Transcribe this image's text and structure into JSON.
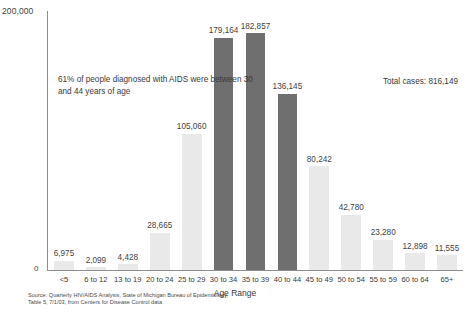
{
  "chart_data": {
    "type": "bar",
    "title": "",
    "xlabel": "Age Range",
    "ylabel": "",
    "ylim": [
      0,
      200000
    ],
    "grid": false,
    "legend": "none",
    "y_tick_labels": [
      "0",
      "200,000"
    ],
    "categories": [
      "<5",
      "6 to 12",
      "13 to 19",
      "20 to 24",
      "25 to 29",
      "30 to 34",
      "35 to 39",
      "40 to 44",
      "45 to 49",
      "50 to 54",
      "55 to 59",
      "60 to 64",
      "65+"
    ],
    "values": [
      6975,
      2099,
      4428,
      28665,
      105060,
      179164,
      182857,
      136145,
      80242,
      42780,
      23280,
      12898,
      11555
    ],
    "value_labels": [
      "6,975",
      "2,099",
      "4,428",
      "28,665",
      "105,060",
      "179,164",
      "182,857",
      "136,145",
      "80,242",
      "42,780",
      "23,280",
      "12,898",
      "11,555"
    ],
    "bar_styles": [
      "light",
      "light",
      "light",
      "light",
      "light",
      "dark",
      "dark",
      "dark",
      "light",
      "light",
      "light",
      "light",
      "light"
    ],
    "annotations": [
      "61% of people diagnosed with AIDS were between 30 and 44 years of age",
      "Total cases: 816,149"
    ],
    "colors": {
      "bar_light": "#e9e9e9",
      "bar_dark": "#6f6f6f",
      "axis": "#8d8d8d",
      "text": "#3a3a3a",
      "background": "#ffffff"
    }
  },
  "annotation_text": "61% of people diagnosed with AIDS were between 30 and 44 years of age",
  "total_cases_text": "Total cases: 816,149",
  "axis": {
    "y_max_label": "200,000",
    "y_zero_label": "0",
    "x_title": "Age Range"
  },
  "source": {
    "line1": "Source: Quarterly HIV/AIDS Analysis, State of Michigan Bureau of Epidemiology,",
    "line2": "Table 5, 7/1/03, from Centers for Disease Control data"
  }
}
